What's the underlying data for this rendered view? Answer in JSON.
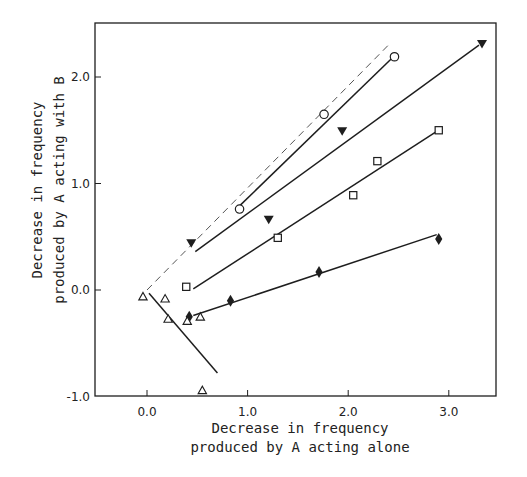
{
  "chart_data": {
    "type": "scatter",
    "title": "",
    "xlabel": [
      "Decrease in frequency",
      "produced by A acting alone"
    ],
    "ylabel": [
      "Decrease in frequency",
      "produced by A acting with B"
    ],
    "xlim": [
      -0.52,
      3.45
    ],
    "ylim": [
      -1.0,
      2.5
    ],
    "x_ticks": [
      0.0,
      1.0,
      2.0,
      3.0
    ],
    "x_tick_labels": [
      "0.0",
      "1.0",
      "2.0",
      "3.0"
    ],
    "y_ticks": [
      -1.0,
      0.0,
      1.0,
      2.0
    ],
    "y_tick_labels": [
      "-1.0",
      "0.0",
      "1.0",
      "2.0"
    ],
    "grid": false,
    "legend": null,
    "reference_line": {
      "style": "dashed",
      "x": [
        0.0,
        2.4
      ],
      "y": [
        0.0,
        2.3
      ],
      "note": "line of identity (y = x)"
    },
    "series": [
      {
        "name": "open circles",
        "marker": "circle-open",
        "x": [
          0.92,
          1.76,
          2.46
        ],
        "y": [
          0.76,
          1.65,
          2.19
        ],
        "fit": {
          "x": [
            0.92,
            2.46
          ],
          "y": [
            0.79,
            2.2
          ]
        }
      },
      {
        "name": "filled inverted triangles",
        "marker": "triangle-down-filled",
        "x": [
          0.44,
          1.21,
          1.94,
          3.33
        ],
        "y": [
          0.44,
          0.66,
          1.49,
          2.31
        ],
        "fit": {
          "x": [
            0.48,
            3.3
          ],
          "y": [
            0.36,
            2.3
          ]
        }
      },
      {
        "name": "open squares",
        "marker": "square-open",
        "x": [
          0.39,
          1.3,
          2.05,
          2.29,
          2.9
        ],
        "y": [
          0.03,
          0.49,
          0.89,
          1.21,
          1.5
        ],
        "fit": {
          "x": [
            0.46,
            2.88
          ],
          "y": [
            0.01,
            1.49
          ]
        }
      },
      {
        "name": "filled diamonds",
        "marker": "diamond-filled",
        "x": [
          0.42,
          0.83,
          1.71,
          2.9
        ],
        "y": [
          -0.25,
          -0.1,
          0.17,
          0.48
        ],
        "fit": {
          "x": [
            0.46,
            2.88
          ],
          "y": [
            -0.24,
            0.52
          ]
        }
      },
      {
        "name": "open triangles",
        "marker": "triangle-up-open",
        "x": [
          -0.04,
          0.18,
          0.21,
          0.4,
          0.53,
          0.55
        ],
        "y": [
          -0.06,
          -0.08,
          -0.27,
          -0.29,
          -0.25,
          -0.94
        ],
        "fit": {
          "x": [
            0.02,
            0.7
          ],
          "y": [
            -0.03,
            -0.78
          ]
        }
      }
    ]
  }
}
